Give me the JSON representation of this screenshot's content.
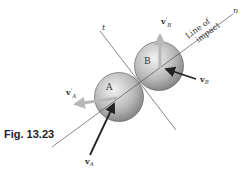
{
  "figure": {
    "caption": "Fig. 13.23",
    "line_n_label": "n",
    "line_t_label": "t",
    "line_of_impact_1": "Line of",
    "line_of_impact_2": "impact",
    "sphere_a_label": "A",
    "sphere_b_label": "B",
    "vectors": {
      "vA": {
        "symbol": "v",
        "sub": "A",
        "prime": ""
      },
      "vB": {
        "symbol": "v",
        "sub": "B",
        "prime": ""
      },
      "vA_prime": {
        "symbol": "v",
        "sub": "A",
        "prime": "′"
      },
      "vB_prime": {
        "symbol": "v",
        "sub": "B",
        "prime": "′"
      }
    },
    "colors": {
      "line": "#555555",
      "dark_arrow": "#222222",
      "light_arrow": "#b8b8b8",
      "sphere_light": "#e4e4e4",
      "sphere_dark": "#8a8a8a"
    }
  }
}
